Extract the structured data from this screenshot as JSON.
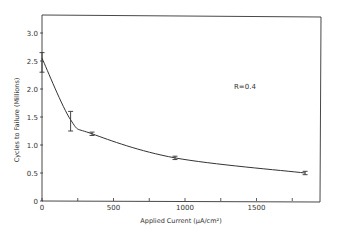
{
  "chart_data": {
    "type": "line",
    "title": "",
    "xlabel": "Applied Current (μA/cm²)",
    "ylabel": "Cycles to Failure (Millions)",
    "annotation": "R=0.4",
    "xlim": [
      0,
      1950
    ],
    "ylim": [
      0,
      3.2
    ],
    "x_ticks": [
      0,
      500,
      1000,
      1500
    ],
    "x_minor_ticks": [
      250,
      750,
      1250,
      1750
    ],
    "y_ticks": [
      0,
      0.5,
      1.0,
      1.5,
      2.0,
      2.5,
      3.0
    ],
    "y_tick_labels": [
      "0",
      "0.5",
      "1.0",
      "1.5",
      "2.0",
      "2.5",
      "3.0"
    ],
    "x_tick_labels": [
      "0",
      "500",
      "1000",
      "1500"
    ],
    "grid": false,
    "legend": null,
    "series": [
      {
        "name": "R=0.4",
        "x": [
          0,
          200,
          350,
          930,
          1840
        ],
        "y": [
          2.55,
          1.45,
          1.2,
          0.77,
          0.5
        ],
        "error_low": [
          2.3,
          1.25,
          1.17,
          0.74,
          0.47
        ],
        "error_high": [
          2.65,
          1.6,
          1.23,
          0.8,
          0.53
        ]
      }
    ]
  }
}
